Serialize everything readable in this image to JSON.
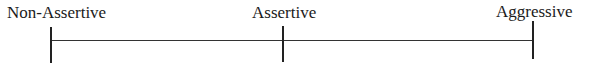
{
  "scale": {
    "type": "continuum",
    "points": [
      {
        "label": "Non-Assertive",
        "x": 51
      },
      {
        "label": "Assertive",
        "x": 283
      },
      {
        "label": "Aggressive",
        "x": 533
      }
    ],
    "line_color": "#333333"
  }
}
